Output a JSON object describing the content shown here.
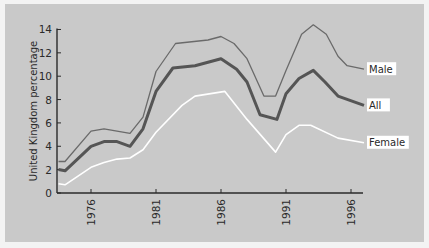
{
  "chart_data": {
    "type": "line",
    "title": "",
    "xlabel": "",
    "ylabel": "United Kingdom percentage",
    "ylim": [
      0,
      14
    ],
    "yticks": [
      0,
      2,
      4,
      6,
      8,
      10,
      12,
      14
    ],
    "xticks": [
      "1976",
      "1981",
      "1986",
      "1991",
      "1996"
    ],
    "xlim": [
      1973.5,
      1997.5
    ],
    "grid": false,
    "legend": "inline labels at right end of lines",
    "series": [
      {
        "name": "Male",
        "color": "#6a6a6a",
        "width": 1.3,
        "points": [
          [
            1973.5,
            2.7
          ],
          [
            1974,
            2.7
          ],
          [
            1976,
            5.3
          ],
          [
            1977,
            5.5
          ],
          [
            1979,
            5.1
          ],
          [
            1980,
            6.5
          ],
          [
            1981,
            10.4
          ],
          [
            1982.5,
            12.8
          ],
          [
            1985,
            13.1
          ],
          [
            1986,
            13.4
          ],
          [
            1987,
            12.8
          ],
          [
            1988,
            11.5
          ],
          [
            1989.3,
            8.3
          ],
          [
            1990.2,
            8.3
          ],
          [
            1991,
            10.5
          ],
          [
            1992.2,
            13.6
          ],
          [
            1993.1,
            14.4
          ],
          [
            1994.1,
            13.6
          ],
          [
            1995,
            11.7
          ],
          [
            1995.7,
            10.9
          ],
          [
            1997,
            10.6
          ]
        ]
      },
      {
        "name": "All",
        "color": "#555555",
        "width": 3,
        "points": [
          [
            1973.5,
            2.0
          ],
          [
            1974,
            1.9
          ],
          [
            1976,
            4.0
          ],
          [
            1977,
            4.4
          ],
          [
            1978,
            4.4
          ],
          [
            1979,
            4.0
          ],
          [
            1980,
            5.5
          ],
          [
            1981,
            8.7
          ],
          [
            1982.3,
            10.7
          ],
          [
            1984,
            10.9
          ],
          [
            1986,
            11.5
          ],
          [
            1987.2,
            10.6
          ],
          [
            1988,
            9.5
          ],
          [
            1989,
            6.7
          ],
          [
            1990.3,
            6.3
          ],
          [
            1991,
            8.5
          ],
          [
            1992,
            9.8
          ],
          [
            1993.1,
            10.5
          ],
          [
            1994,
            9.5
          ],
          [
            1995,
            8.3
          ],
          [
            1997,
            7.5
          ]
        ]
      },
      {
        "name": "Female",
        "color": "#ffffff",
        "width": 1.6,
        "points": [
          [
            1973.5,
            0.8
          ],
          [
            1974,
            0.7
          ],
          [
            1976,
            2.2
          ],
          [
            1977,
            2.6
          ],
          [
            1978,
            2.9
          ],
          [
            1979,
            3.0
          ],
          [
            1980,
            3.7
          ],
          [
            1981,
            5.2
          ],
          [
            1983,
            7.5
          ],
          [
            1984,
            8.3
          ],
          [
            1986.3,
            8.7
          ],
          [
            1988,
            6.3
          ],
          [
            1990.2,
            3.5
          ],
          [
            1991,
            5.0
          ],
          [
            1992,
            5.8
          ],
          [
            1992.9,
            5.8
          ],
          [
            1995,
            4.7
          ],
          [
            1997,
            4.3
          ]
        ]
      }
    ]
  },
  "colors": {
    "panel_bg": "#c9c9c9",
    "page_bg": "#f3f3f3",
    "axis": "#2a2a2a",
    "label_box": "#ffffff"
  }
}
